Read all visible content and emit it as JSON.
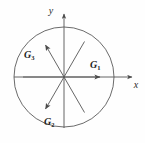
{
  "figure": {
    "background_color": "#fefefe",
    "stroke_color": "#555555",
    "label_color": "#1c1c1c",
    "circle": {
      "center_x": 64,
      "center_y": 77,
      "radius": 50
    },
    "axes": {
      "x_label": "x",
      "y_label": "y",
      "x_axis": {
        "x1": 14,
        "y1": 77,
        "x2": 134,
        "y2": 77
      },
      "y_axis": {
        "x1": 64,
        "y1": 130,
        "x2": 64,
        "y2": 12
      }
    },
    "vectors": [
      {
        "name": "G",
        "subscript": "1",
        "label": "G₁",
        "angle_deg": 0,
        "length": 39,
        "label_x": 91,
        "label_y": 68
      },
      {
        "name": "G",
        "subscript": "2",
        "label": "G₂",
        "angle_deg": 240,
        "length": 39,
        "label_x": 45,
        "label_y": 124
      },
      {
        "name": "G",
        "subscript": "3",
        "label": "G₃",
        "angle_deg": 120,
        "length": 39,
        "label_x": 24,
        "label_y": 60
      }
    ],
    "plain_rays": [
      {
        "angle_deg": 60,
        "length": 41
      },
      {
        "angle_deg": 180,
        "length": 41
      },
      {
        "angle_deg": 300,
        "length": 41
      }
    ]
  }
}
